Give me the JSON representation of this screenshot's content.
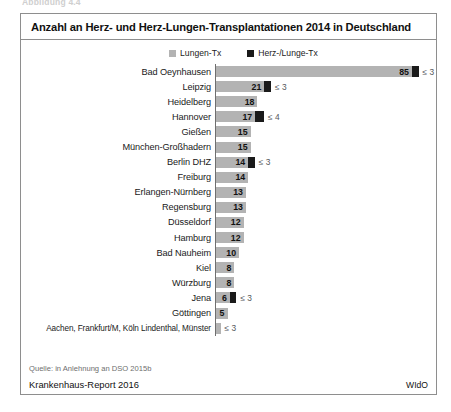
{
  "figure_caption_top": "Abbildung 4.4",
  "chart_data": {
    "type": "bar",
    "orientation": "horizontal",
    "title": "Anzahl an Herz- und Herz-Lungen-Transplantationen 2014 in Deutschland",
    "xlabel": "",
    "ylabel": "",
    "grid": false,
    "legend_position": "top-center",
    "legend": [
      {
        "label": "Lungen-Tx",
        "color": "#b3b3b3"
      },
      {
        "label": "Herz-/Lunge-Tx",
        "color": "#1a1a1a"
      }
    ],
    "categories": [
      "Bad Oeynhausen",
      "Leipzig",
      "Heidelberg",
      "Hannover",
      "Gießen",
      "München-Großhadern",
      "Berlin DHZ",
      "Freiburg",
      "Erlangen-Nürnberg",
      "Regensburg",
      "Düsseldorf",
      "Hamburg",
      "Bad Nauheim",
      "Kiel",
      "Würzburg",
      "Jena",
      "Göttingen",
      "Aachen, Frankfurt/M, Köln Lindenthal, Münster"
    ],
    "series": [
      {
        "name": "Lungen-Tx",
        "color": "#b3b3b3",
        "values": [
          85,
          21,
          18,
          17,
          15,
          15,
          14,
          14,
          13,
          13,
          12,
          12,
          10,
          8,
          8,
          6,
          5,
          2
        ]
      },
      {
        "name": "Herz-/Lunge-Tx",
        "color": "#1a1a1a",
        "values": [
          3,
          3,
          0,
          4,
          0,
          0,
          3,
          0,
          0,
          0,
          0,
          0,
          0,
          0,
          0,
          3,
          0,
          0
        ]
      }
    ],
    "value_labels": [
      "85",
      "21",
      "18",
      "17",
      "15",
      "15",
      "14",
      "14",
      "13",
      "13",
      "12",
      "12",
      "10",
      "8",
      "8",
      "6",
      "5",
      ""
    ],
    "annotations": [
      "≤ 3",
      "≤ 3",
      "",
      "≤ 4",
      "",
      "",
      "≤ 3",
      "",
      "",
      "",
      "",
      "",
      "",
      "",
      "",
      "≤ 3",
      "",
      "≤ 3"
    ],
    "xlim": [
      0,
      90
    ]
  },
  "rows": [
    {
      "label": "Bad Oeynhausen",
      "gray": 85,
      "value": "85",
      "black": 3,
      "note": "≤ 3"
    },
    {
      "label": "Leipzig",
      "gray": 21,
      "value": "21",
      "black": 3,
      "note": "≤ 3"
    },
    {
      "label": "Heidelberg",
      "gray": 18,
      "value": "18",
      "black": 0,
      "note": ""
    },
    {
      "label": "Hannover",
      "gray": 17,
      "value": "17",
      "black": 4,
      "note": "≤ 4"
    },
    {
      "label": "Gießen",
      "gray": 15,
      "value": "15",
      "black": 0,
      "note": ""
    },
    {
      "label": "München-Großhadern",
      "gray": 15,
      "value": "15",
      "black": 0,
      "note": ""
    },
    {
      "label": "Berlin DHZ",
      "gray": 14,
      "value": "14",
      "black": 3,
      "note": "≤ 3"
    },
    {
      "label": "Freiburg",
      "gray": 14,
      "value": "14",
      "black": 0,
      "note": ""
    },
    {
      "label": "Erlangen-Nürnberg",
      "gray": 13,
      "value": "13",
      "black": 0,
      "note": ""
    },
    {
      "label": "Regensburg",
      "gray": 13,
      "value": "13",
      "black": 0,
      "note": ""
    },
    {
      "label": "Düsseldorf",
      "gray": 12,
      "value": "12",
      "black": 0,
      "note": ""
    },
    {
      "label": "Hamburg",
      "gray": 12,
      "value": "12",
      "black": 0,
      "note": ""
    },
    {
      "label": "Bad Nauheim",
      "gray": 10,
      "value": "10",
      "black": 0,
      "note": ""
    },
    {
      "label": "Kiel",
      "gray": 8,
      "value": "8",
      "black": 0,
      "note": ""
    },
    {
      "label": "Würzburg",
      "gray": 8,
      "value": "8",
      "black": 0,
      "note": ""
    },
    {
      "label": "Jena",
      "gray": 6,
      "value": "6",
      "black": 3,
      "note": "≤ 3"
    },
    {
      "label": "Göttingen",
      "gray": 5,
      "value": "5",
      "black": 0,
      "note": ""
    },
    {
      "label": "Aachen, Frankfurt/M, Köln Lindenthal, Münster",
      "gray": 2,
      "value": "",
      "black": 0,
      "note": "≤ 3"
    }
  ],
  "footer": {
    "source": "Quelle: in Anlehnung an DSO 2015b",
    "report": "Krankenhaus-Report 2016",
    "publisher": "WIdO"
  }
}
